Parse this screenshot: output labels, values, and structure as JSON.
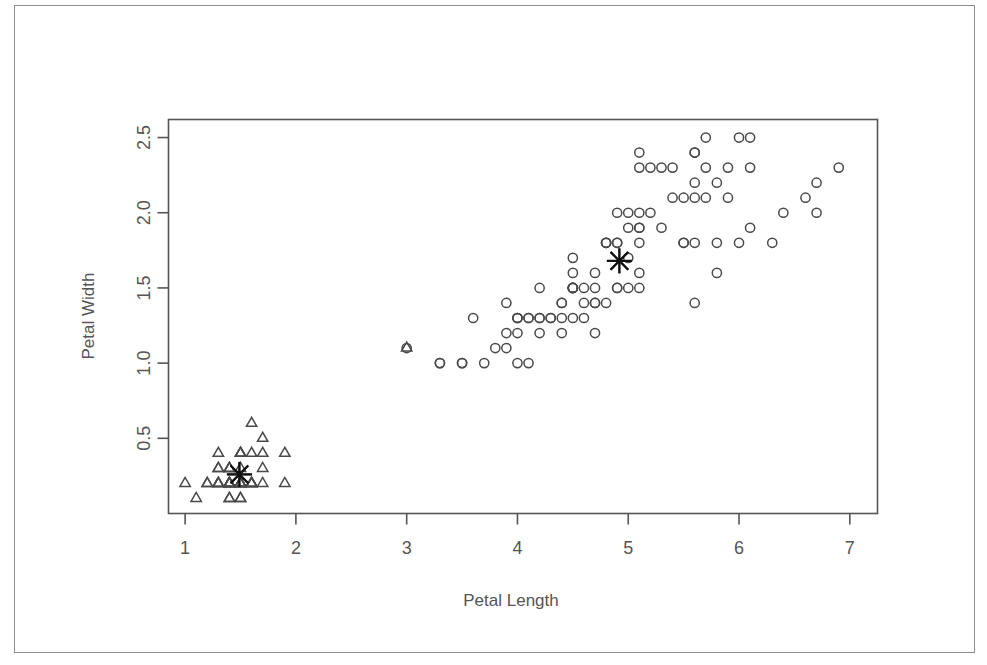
{
  "figure": {
    "background_color": "#ffffff",
    "ink_color": "#4a4a4a",
    "axis_color": "#555555",
    "centroid_color": "#111111",
    "outer_border_color": "#8d8d8d"
  },
  "chart_data": {
    "type": "scatter",
    "title": "",
    "xlabel": "Petal Length",
    "ylabel": "Petal Width",
    "xlim": [
      0.85,
      7.25
    ],
    "ylim": [
      0.0,
      2.62
    ],
    "xticks": [
      1,
      2,
      3,
      4,
      5,
      6,
      7
    ],
    "xtick_labels": [
      "1",
      "2",
      "3",
      "4",
      "5",
      "6",
      "7"
    ],
    "yticks": [
      0.5,
      1.0,
      1.5,
      2.0,
      2.5
    ],
    "ytick_labels": [
      "0.5",
      "1.0",
      "1.5",
      "2.0",
      "2.5"
    ],
    "grid": false,
    "legend": "none",
    "series": [
      {
        "name": "Cluster 1",
        "marker": "triangle",
        "points": [
          [
            1.4,
            0.2
          ],
          [
            1.4,
            0.2
          ],
          [
            1.3,
            0.2
          ],
          [
            1.5,
            0.2
          ],
          [
            1.4,
            0.2
          ],
          [
            1.7,
            0.4
          ],
          [
            1.4,
            0.3
          ],
          [
            1.5,
            0.2
          ],
          [
            1.4,
            0.2
          ],
          [
            1.5,
            0.1
          ],
          [
            1.5,
            0.2
          ],
          [
            1.6,
            0.2
          ],
          [
            1.4,
            0.1
          ],
          [
            1.1,
            0.1
          ],
          [
            1.2,
            0.2
          ],
          [
            1.5,
            0.4
          ],
          [
            1.3,
            0.4
          ],
          [
            1.4,
            0.3
          ],
          [
            1.7,
            0.3
          ],
          [
            1.5,
            0.3
          ],
          [
            1.7,
            0.2
          ],
          [
            1.5,
            0.4
          ],
          [
            1.0,
            0.2
          ],
          [
            1.7,
            0.5
          ],
          [
            1.9,
            0.2
          ],
          [
            1.6,
            0.2
          ],
          [
            1.6,
            0.4
          ],
          [
            1.5,
            0.2
          ],
          [
            1.4,
            0.2
          ],
          [
            1.6,
            0.2
          ],
          [
            1.6,
            0.2
          ],
          [
            1.5,
            0.4
          ],
          [
            1.5,
            0.1
          ],
          [
            1.4,
            0.2
          ],
          [
            1.5,
            0.2
          ],
          [
            1.2,
            0.2
          ],
          [
            1.3,
            0.2
          ],
          [
            1.4,
            0.1
          ],
          [
            1.3,
            0.2
          ],
          [
            1.5,
            0.2
          ],
          [
            1.3,
            0.3
          ],
          [
            1.3,
            0.3
          ],
          [
            1.3,
            0.2
          ],
          [
            1.6,
            0.6
          ],
          [
            1.9,
            0.4
          ],
          [
            1.4,
            0.3
          ],
          [
            1.6,
            0.2
          ],
          [
            1.4,
            0.2
          ],
          [
            1.5,
            0.2
          ],
          [
            1.4,
            0.2
          ],
          [
            3.0,
            1.1
          ]
        ]
      },
      {
        "name": "Cluster 2",
        "marker": "circle",
        "points": [
          [
            4.7,
            1.4
          ],
          [
            4.5,
            1.5
          ],
          [
            4.9,
            1.5
          ],
          [
            4.0,
            1.3
          ],
          [
            4.6,
            1.5
          ],
          [
            4.5,
            1.3
          ],
          [
            4.7,
            1.6
          ],
          [
            3.3,
            1.0
          ],
          [
            4.6,
            1.3
          ],
          [
            3.9,
            1.4
          ],
          [
            3.5,
            1.0
          ],
          [
            4.2,
            1.5
          ],
          [
            4.0,
            1.0
          ],
          [
            4.7,
            1.4
          ],
          [
            3.6,
            1.3
          ],
          [
            4.4,
            1.4
          ],
          [
            4.5,
            1.5
          ],
          [
            4.1,
            1.0
          ],
          [
            4.5,
            1.5
          ],
          [
            3.9,
            1.1
          ],
          [
            4.8,
            1.8
          ],
          [
            4.0,
            1.3
          ],
          [
            4.9,
            1.5
          ],
          [
            4.7,
            1.2
          ],
          [
            4.3,
            1.3
          ],
          [
            4.4,
            1.4
          ],
          [
            4.8,
            1.4
          ],
          [
            5.0,
            1.7
          ],
          [
            4.5,
            1.5
          ],
          [
            3.5,
            1.0
          ],
          [
            3.8,
            1.1
          ],
          [
            3.7,
            1.0
          ],
          [
            3.9,
            1.2
          ],
          [
            5.1,
            1.6
          ],
          [
            4.5,
            1.5
          ],
          [
            4.5,
            1.6
          ],
          [
            4.7,
            1.5
          ],
          [
            4.4,
            1.3
          ],
          [
            4.1,
            1.3
          ],
          [
            4.0,
            1.3
          ],
          [
            4.4,
            1.2
          ],
          [
            4.6,
            1.4
          ],
          [
            4.0,
            1.2
          ],
          [
            3.3,
            1.0
          ],
          [
            4.2,
            1.3
          ],
          [
            4.2,
            1.2
          ],
          [
            4.2,
            1.3
          ],
          [
            4.3,
            1.3
          ],
          [
            3.0,
            1.1
          ],
          [
            4.1,
            1.3
          ],
          [
            6.0,
            2.5
          ],
          [
            5.1,
            1.9
          ],
          [
            5.9,
            2.1
          ],
          [
            5.6,
            1.8
          ],
          [
            5.8,
            2.2
          ],
          [
            6.6,
            2.1
          ],
          [
            4.5,
            1.7
          ],
          [
            6.3,
            1.8
          ],
          [
            5.8,
            1.8
          ],
          [
            6.1,
            2.5
          ],
          [
            5.1,
            2.0
          ],
          [
            5.3,
            1.9
          ],
          [
            5.5,
            2.1
          ],
          [
            5.0,
            2.0
          ],
          [
            5.1,
            2.4
          ],
          [
            5.3,
            2.3
          ],
          [
            5.5,
            1.8
          ],
          [
            6.7,
            2.2
          ],
          [
            6.9,
            2.3
          ],
          [
            5.0,
            1.5
          ],
          [
            5.7,
            2.3
          ],
          [
            4.9,
            2.0
          ],
          [
            6.7,
            2.0
          ],
          [
            4.9,
            1.8
          ],
          [
            5.7,
            2.1
          ],
          [
            6.0,
            1.8
          ],
          [
            4.8,
            1.8
          ],
          [
            4.9,
            1.8
          ],
          [
            5.6,
            2.1
          ],
          [
            5.8,
            1.6
          ],
          [
            6.1,
            1.9
          ],
          [
            6.4,
            2.0
          ],
          [
            5.6,
            2.2
          ],
          [
            5.1,
            1.5
          ],
          [
            5.6,
            1.4
          ],
          [
            6.1,
            2.3
          ],
          [
            5.6,
            2.4
          ],
          [
            5.5,
            1.8
          ],
          [
            4.8,
            1.8
          ],
          [
            5.4,
            2.1
          ],
          [
            5.6,
            2.4
          ],
          [
            5.1,
            2.3
          ],
          [
            5.1,
            1.9
          ],
          [
            5.9,
            2.3
          ],
          [
            5.7,
            2.5
          ],
          [
            5.2,
            2.3
          ],
          [
            5.0,
            1.9
          ],
          [
            5.2,
            2.0
          ],
          [
            5.4,
            2.3
          ],
          [
            5.1,
            1.8
          ]
        ]
      }
    ],
    "centroids": [
      {
        "name": "centroid-cluster-1",
        "marker": "asterisk",
        "x": 1.49,
        "y": 0.26
      },
      {
        "name": "centroid-cluster-2",
        "marker": "asterisk",
        "x": 4.92,
        "y": 1.68
      }
    ]
  }
}
